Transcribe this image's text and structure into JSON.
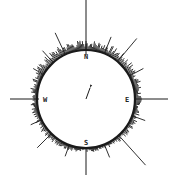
{
  "diagram": {
    "type": "circular-histogram",
    "center": [
      86,
      99
    ],
    "radius": 49,
    "colors": {
      "ink": "#1a1a1a",
      "background": "#ffffff"
    },
    "cardinal_labels": [
      {
        "key": "N",
        "text": "N"
      },
      {
        "key": "E",
        "text": "E"
      },
      {
        "key": "S",
        "text": "S"
      },
      {
        "key": "W",
        "text": "W"
      }
    ],
    "axis_lines": [
      {
        "dir": "N",
        "angle": 0,
        "inner": 44,
        "outer": 99
      },
      {
        "dir": "E",
        "angle": 90,
        "inner": 48,
        "outer": 82
      },
      {
        "dir": "S",
        "angle": 180,
        "inner": 49,
        "outer": 76
      },
      {
        "dir": "W",
        "angle": 270,
        "inner": 47,
        "outer": 76
      }
    ],
    "long_spikes": [
      {
        "angle": 22,
        "length": 18
      },
      {
        "angle": 40,
        "length": 30
      },
      {
        "angle": 62,
        "length": 16
      },
      {
        "angle": 110,
        "length": 14
      },
      {
        "angle": 138,
        "length": 40
      },
      {
        "angle": 158,
        "length": 14
      },
      {
        "angle": 200,
        "length": 12
      },
      {
        "angle": 225,
        "length": 20
      },
      {
        "angle": 245,
        "length": 12
      },
      {
        "angle": 300,
        "length": 12
      },
      {
        "angle": 318,
        "length": 16
      },
      {
        "angle": 335,
        "length": 24
      }
    ],
    "mean_vector": {
      "angle": 20,
      "length": 12
    }
  }
}
